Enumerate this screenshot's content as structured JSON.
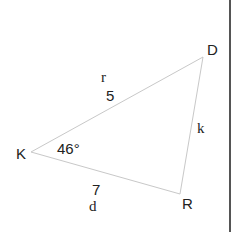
{
  "diagram": {
    "type": "triangle",
    "stroke_color": "#c8c8c8",
    "border_color": "#555555",
    "vertices": [
      {
        "name": "K",
        "x": 31,
        "y": 152
      },
      {
        "name": "D",
        "x": 203,
        "y": 57
      },
      {
        "name": "R",
        "x": 180,
        "y": 194
      }
    ],
    "vertex_labels": {
      "K": "K",
      "D": "D",
      "R": "R"
    },
    "side_labels": {
      "KD_name": "r",
      "KD_length": "5",
      "DR_name": "k",
      "KR_length": "7",
      "KR_name": "d"
    },
    "angle_labels": {
      "K": "46°"
    }
  }
}
